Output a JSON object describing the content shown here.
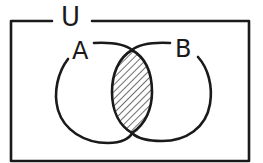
{
  "diagram": {
    "type": "venn",
    "universe_label": "U",
    "sets": [
      {
        "label": "A"
      },
      {
        "label": "B"
      }
    ],
    "shaded_region": "A ∩ B",
    "colors": {
      "stroke": "#1a1a1a",
      "background": "#ffffff",
      "hatch": "#1a1a1a"
    }
  }
}
